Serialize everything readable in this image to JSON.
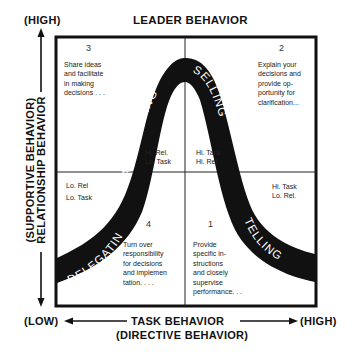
{
  "title": "LEADER BEHAVIOR",
  "y_axis": {
    "high": "(HIGH)",
    "low": "(LOW)",
    "label": "RELATIONSHIP BEHAVIOR",
    "sublabel": "(SUPPORTIVE BEHAVIOR)"
  },
  "x_axis": {
    "low": "(LOW)",
    "high": "(HIGH)",
    "label": "TASK BEHAVIOR",
    "sublabel": "(DIRECTIVE BEHAVIOR)"
  },
  "quadrants": [
    {
      "number": "3",
      "style": "PARTICIPATING",
      "lines": [
        "Share ideas",
        "and facilitate",
        "in making",
        "decisions . . ."
      ],
      "code": [
        "Hi. Rel.",
        "Lo. Task"
      ]
    },
    {
      "number": "2",
      "style": "SELLING",
      "lines": [
        "Explain your",
        "decisions and",
        "provide op-",
        "portunity for",
        "clarification..."
      ],
      "code": [
        "Hi. Task",
        "Hi. Rel."
      ]
    },
    {
      "number": "4",
      "style": "DELEGATING",
      "lines": [
        "Turn over",
        "responsibility",
        "for decisions",
        "and implemen",
        "tation. . . ."
      ],
      "code": [
        "Lo. Rel",
        "Lo. Task"
      ]
    },
    {
      "number": "1",
      "style": "TELLING",
      "lines": [
        "Provide",
        "specific in-",
        "structions",
        "and closely",
        "supervise",
        "performance. . ."
      ],
      "code": [
        "Hi. Task",
        "Lo. Rel."
      ]
    }
  ],
  "colors": {
    "ink": "#111111",
    "background": "#ffffff"
  }
}
